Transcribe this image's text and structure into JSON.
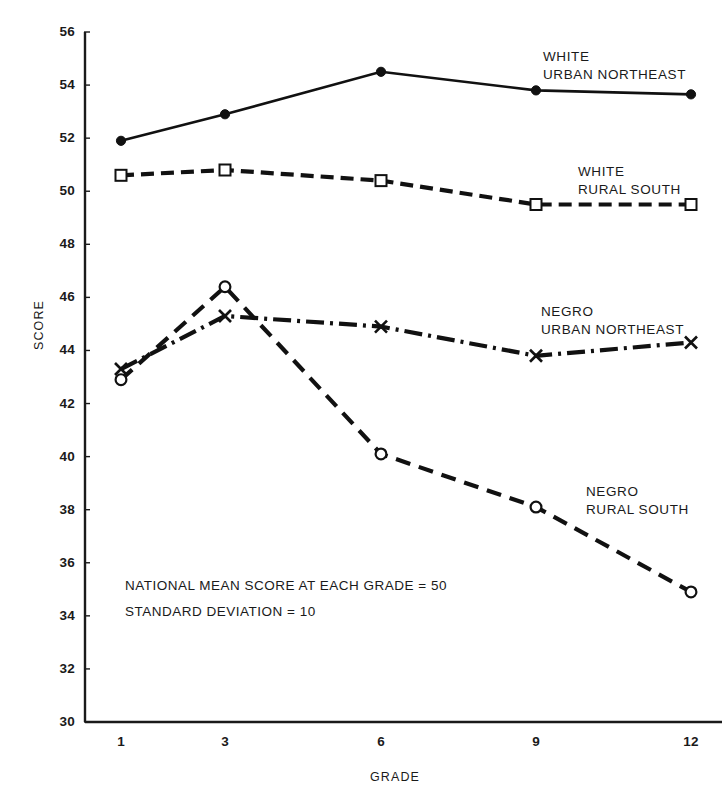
{
  "chart_data": {
    "type": "line",
    "title": "",
    "xlabel": "GRADE",
    "ylabel": "SCORE",
    "x": [
      1,
      3,
      6,
      9,
      12
    ],
    "xtick_labels": [
      "1",
      "3",
      "6",
      "9",
      "12"
    ],
    "ytick_labels": [
      "30",
      "32",
      "34",
      "36",
      "38",
      "40",
      "42",
      "44",
      "46",
      "48",
      "50",
      "52",
      "54",
      "56"
    ],
    "yticks": [
      30,
      32,
      34,
      36,
      38,
      40,
      42,
      44,
      46,
      48,
      50,
      52,
      54,
      56
    ],
    "ylim": [
      30,
      56
    ],
    "xlim": [
      0,
      13
    ],
    "grid": false,
    "legend_position": "inline-right-of-series",
    "series": [
      {
        "name": "WHITE URBAN NORTHEAST",
        "label_lines": [
          "WHITE",
          "URBAN NORTHEAST"
        ],
        "marker": "filled-circle",
        "line_style": "solid",
        "color": "#111111",
        "values": [
          51.9,
          52.9,
          54.5,
          53.8,
          53.65
        ]
      },
      {
        "name": "WHITE RURAL SOUTH",
        "label_lines": [
          "WHITE",
          "RURAL SOUTH"
        ],
        "marker": "open-square",
        "line_style": "dashed",
        "color": "#111111",
        "values": [
          50.6,
          50.8,
          50.4,
          49.5,
          49.5
        ]
      },
      {
        "name": "NEGRO URBAN NORTHEAST",
        "label_lines": [
          "NEGRO",
          "URBAN NORTHEAST"
        ],
        "marker": "x-cross",
        "line_style": "dash-dot",
        "color": "#111111",
        "values": [
          43.3,
          45.3,
          44.9,
          43.8,
          44.3
        ]
      },
      {
        "name": "NEGRO RURAL SOUTH",
        "label_lines": [
          "NEGRO",
          "RURAL SOUTH"
        ],
        "marker": "open-circle",
        "line_style": "dashed-long",
        "color": "#111111",
        "values": [
          42.9,
          46.4,
          40.1,
          38.1,
          34.9
        ]
      }
    ],
    "annotations": [
      "NATIONAL MEAN SCORE AT EACH GRADE = 50",
      "STANDARD DEVIATION = 10"
    ]
  },
  "series_label_positions": [
    {
      "left": 543,
      "top": 48
    },
    {
      "left": 578,
      "top": 163
    },
    {
      "left": 541,
      "top": 303
    },
    {
      "left": 586,
      "top": 483
    }
  ],
  "annotation_positions": [
    {
      "left": 125,
      "top": 578
    },
    {
      "left": 125,
      "top": 604
    }
  ],
  "axis_geometry": {
    "plot_left": 85,
    "plot_right": 722,
    "plot_top": 32,
    "plot_bottom": 722,
    "x_positions": [
      121,
      225,
      381,
      536,
      691
    ]
  }
}
